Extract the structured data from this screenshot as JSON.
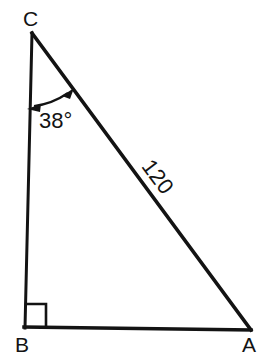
{
  "figure": {
    "type": "right-triangle-diagram",
    "background_color": "#ffffff",
    "stroke_color": "#131313",
    "stroke_width": 3
  },
  "vertices": {
    "C": {
      "label": "C",
      "x": 32,
      "y": 33
    },
    "B": {
      "label": "B",
      "x": 25,
      "y": 327
    },
    "A": {
      "label": "A",
      "x": 250,
      "y": 330
    }
  },
  "angle": {
    "at_vertex": "C",
    "label": "38°",
    "value": 38,
    "unit": "degrees",
    "marker": "double-headed-curved-arrow"
  },
  "right_angle": {
    "at_vertex": "B",
    "marker": "square",
    "size": 20
  },
  "sides": {
    "hypotenuse": {
      "from": "C",
      "to": "A",
      "label": "120",
      "value": 120,
      "label_rotation_deg": 53
    },
    "vertical": {
      "from": "C",
      "to": "B",
      "label": ""
    },
    "base": {
      "from": "B",
      "to": "A",
      "label": ""
    }
  }
}
